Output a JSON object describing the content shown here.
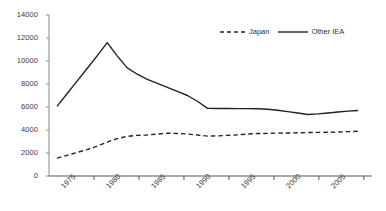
{
  "chart_data": {
    "type": "line",
    "title": "",
    "xlabel": "",
    "ylabel": "",
    "ylim": [
      0,
      14000
    ],
    "ytick_values": [
      0,
      2000,
      4000,
      6000,
      8000,
      10000,
      12000,
      14000
    ],
    "ytick_labels": [
      "0",
      "2000",
      "4000",
      "6000",
      "8000",
      "10000",
      "12000",
      "14000"
    ],
    "grid": false,
    "legend_position": "top-right",
    "x": [
      1975,
      1976,
      1977,
      1978,
      1979,
      1980,
      1981,
      1982,
      1983,
      1984,
      1985,
      1986,
      1987,
      1988,
      1989,
      1990,
      1991,
      1992,
      1993,
      1994,
      1995,
      1996,
      1997,
      1998,
      1999,
      2000,
      2001,
      2002,
      2003,
      2004,
      2005
    ],
    "xtick_values": [
      1975,
      1980,
      1985,
      1990,
      1995,
      2000,
      2005
    ],
    "xtick_labels": [
      "1975",
      "1980",
      "1985",
      "1990",
      "1995",
      "2000",
      "2005"
    ],
    "series": [
      {
        "name": "Japan",
        "style": "dashed",
        "color": "#222222",
        "values": [
          1550,
          1800,
          2050,
          2300,
          2600,
          2950,
          3250,
          3450,
          3530,
          3570,
          3650,
          3720,
          3700,
          3650,
          3560,
          3470,
          3490,
          3530,
          3580,
          3650,
          3690,
          3710,
          3730,
          3740,
          3760,
          3780,
          3790,
          3800,
          3820,
          3860,
          3890
        ]
      },
      {
        "name": "Other IEA",
        "style": "solid",
        "color": "#222222",
        "values": [
          6050,
          7150,
          8250,
          9350,
          10450,
          11600,
          10450,
          9400,
          8850,
          8400,
          8050,
          7700,
          7350,
          7000,
          6500,
          5880,
          5870,
          5865,
          5860,
          5855,
          5850,
          5800,
          5720,
          5600,
          5480,
          5350,
          5400,
          5480,
          5560,
          5640,
          5700
        ]
      }
    ]
  },
  "legend": {
    "entries": [
      {
        "label": "Japan",
        "style": "dashed"
      },
      {
        "label": "Other IEA",
        "style": "solid"
      }
    ]
  }
}
